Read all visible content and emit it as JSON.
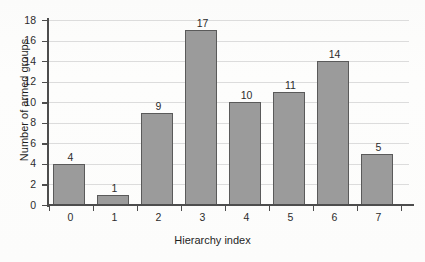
{
  "chart_data": {
    "type": "bar",
    "title": "",
    "xlabel": "Hierarchy index",
    "ylabel": "Number of armed groups",
    "categories": [
      "0",
      "1",
      "2",
      "3",
      "4",
      "5",
      "6",
      "7"
    ],
    "values": [
      4,
      1,
      9,
      17,
      10,
      11,
      14,
      5
    ],
    "bar_labels": [
      "4",
      "1",
      "9",
      "17",
      "10",
      "11",
      "14",
      "5"
    ],
    "ylim": [
      0,
      18
    ],
    "ytick_values": [
      0,
      2,
      4,
      6,
      8,
      10,
      12,
      14,
      16,
      18
    ],
    "ytick_labels": [
      "0",
      "2",
      "4",
      "6",
      "8",
      "10",
      "12",
      "14",
      "16",
      "18"
    ],
    "grid": "horizontal",
    "legend": "none",
    "colors": {
      "bar_fill": "#9b9b9b",
      "bar_edge": "#5a5a5a",
      "gridline": "#dcdcdc",
      "axis": "#4d4d4d",
      "text": "#1f1f1f",
      "background": "#fdfdfc"
    }
  }
}
